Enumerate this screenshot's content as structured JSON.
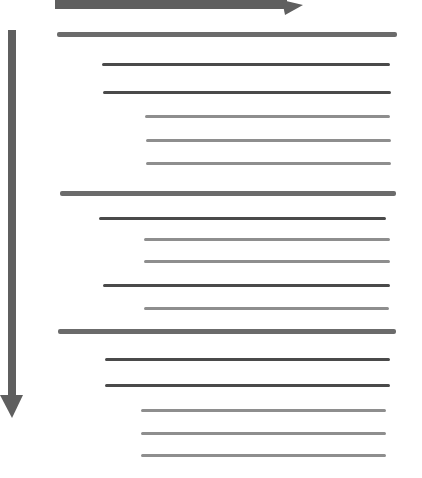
{
  "diagram": {
    "type": "hierarchical-outline",
    "colors": {
      "arrow": "#5a5a5a",
      "level1": "#6b6b6b",
      "level2": "#4a4a4a",
      "level3": "#8e8e8e",
      "background": "#ffffff"
    },
    "arrows": [
      {
        "name": "horizontal-arrow",
        "direction": "right",
        "x1": 55,
        "y": 4,
        "x2": 303
      },
      {
        "name": "vertical-arrow",
        "direction": "down",
        "x": 12,
        "y1": 30,
        "y2": 418
      }
    ],
    "items": [
      {
        "level": 1,
        "y": 34,
        "x1": 57,
        "x2": 397
      },
      {
        "level": 2,
        "y": 64,
        "x1": 102,
        "x2": 390
      },
      {
        "level": 2,
        "y": 92,
        "x1": 103,
        "x2": 391
      },
      {
        "level": 3,
        "y": 116,
        "x1": 145,
        "x2": 390
      },
      {
        "level": 3,
        "y": 140,
        "x1": 146,
        "x2": 391
      },
      {
        "level": 3,
        "y": 163,
        "x1": 146,
        "x2": 391
      },
      {
        "level": 1,
        "y": 193,
        "x1": 60,
        "x2": 396
      },
      {
        "level": 2,
        "y": 218,
        "x1": 99,
        "x2": 386
      },
      {
        "level": 3,
        "y": 239,
        "x1": 144,
        "x2": 390
      },
      {
        "level": 3,
        "y": 261,
        "x1": 144,
        "x2": 390
      },
      {
        "level": 2,
        "y": 285,
        "x1": 103,
        "x2": 390
      },
      {
        "level": 3,
        "y": 308,
        "x1": 144,
        "x2": 389
      },
      {
        "level": 1,
        "y": 331,
        "x1": 58,
        "x2": 396
      },
      {
        "level": 2,
        "y": 359,
        "x1": 105,
        "x2": 390
      },
      {
        "level": 2,
        "y": 385,
        "x1": 105,
        "x2": 390
      },
      {
        "level": 3,
        "y": 410,
        "x1": 141,
        "x2": 386
      },
      {
        "level": 3,
        "y": 433,
        "x1": 141,
        "x2": 386
      },
      {
        "level": 3,
        "y": 455,
        "x1": 141,
        "x2": 386
      }
    ]
  }
}
